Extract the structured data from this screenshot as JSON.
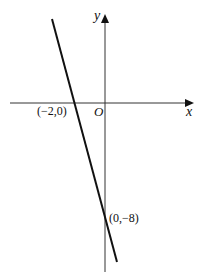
{
  "figure": {
    "type": "coordinate-graph",
    "axes": {
      "x_label": "x",
      "y_label": "y",
      "origin_label": "O"
    },
    "line": {
      "description": "straight line with negative slope",
      "points": [
        {
          "label": "(−2,0)",
          "x": -2,
          "y": 0
        },
        {
          "label": "(0,−8)",
          "x": 0,
          "y": -8
        }
      ]
    },
    "colors": {
      "background": "#ffffff",
      "axes": "#333333",
      "line": "#111111",
      "text": "#111111"
    }
  }
}
